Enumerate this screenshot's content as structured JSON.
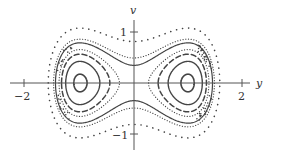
{
  "diagram": {
    "type": "phase-portrait",
    "axes": {
      "horizontal_label": "y",
      "vertical_label": "v",
      "x_ticks": [
        {
          "value": -2,
          "label": "−2"
        },
        {
          "value": 2,
          "label": "2"
        }
      ],
      "y_ticks": [
        {
          "value": 1,
          "label": "1"
        },
        {
          "value": -1,
          "label": "−1"
        }
      ]
    },
    "mapping": {
      "origin_x": 134,
      "origin_y": 83,
      "scale_x": 54,
      "scale_y": 51
    },
    "equilibria": [
      {
        "y": -1,
        "v": 0,
        "kind": "center"
      },
      {
        "y": 1,
        "v": 0,
        "kind": "center"
      },
      {
        "y": 0,
        "v": 0,
        "kind": "saddle"
      }
    ],
    "orbits": [
      {
        "energy": -0.235,
        "style": "solid",
        "width": 1.6,
        "region": "wells"
      },
      {
        "energy": -0.16,
        "style": "solid",
        "width": 1.4,
        "region": "wells"
      },
      {
        "energy": -0.09,
        "style": "dashed",
        "width": 1.5,
        "region": "wells"
      },
      {
        "energy": -0.035,
        "style": "dotted-dense",
        "width": 1.2,
        "region": "wells"
      },
      {
        "energy": 0.06,
        "style": "solid",
        "width": 1.2,
        "region": "outer"
      },
      {
        "energy": 0.12,
        "style": "dotted-dense",
        "width": 1.2,
        "region": "outer"
      },
      {
        "energy": 0.33,
        "style": "dotted-sparse",
        "width": 1.6,
        "region": "outer"
      }
    ],
    "colors": {
      "ink": "#444444",
      "axis": "#555555",
      "background": "#ffffff"
    }
  }
}
